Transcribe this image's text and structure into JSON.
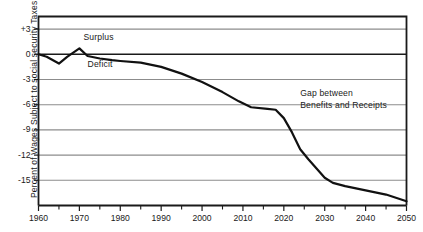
{
  "chart_data": {
    "type": "line",
    "title": "",
    "xlabel": "",
    "ylabel": "Percent of Wages Subject to social security Taxes",
    "xlim": [
      1960,
      2050
    ],
    "ylim": [
      -18,
      4.5
    ],
    "grid": true,
    "legend": "none",
    "x_ticks": [
      1960,
      1970,
      1980,
      1990,
      2000,
      2010,
      2020,
      2030,
      2040,
      2050
    ],
    "x_minor_ticks": [
      1965,
      1975,
      1985,
      1995,
      2005,
      2015,
      2025,
      2035,
      2045
    ],
    "y_ticks": [
      3,
      0,
      -3,
      -6,
      -9,
      -12,
      -15
    ],
    "y_tick_labels": [
      "+3",
      "0",
      "-3",
      "-6",
      "-9",
      "-12",
      "-15"
    ],
    "series": [
      {
        "name": "Gap between Benefits and Receipts",
        "color": "#111111",
        "x": [
          1960,
          1962,
          1965,
          1967,
          1970,
          1972,
          1975,
          1978,
          1980,
          1985,
          1990,
          1995,
          2000,
          2005,
          2009,
          2012,
          2016,
          2018,
          2020,
          2022,
          2024,
          2026,
          2028,
          2030,
          2032,
          2035,
          2040,
          2045,
          2050
        ],
        "values": [
          0.0,
          -0.3,
          -1.1,
          -0.3,
          0.7,
          -0.2,
          -0.5,
          -0.7,
          -0.8,
          -1.0,
          -1.5,
          -2.3,
          -3.3,
          -4.5,
          -5.6,
          -6.3,
          -6.5,
          -6.6,
          -7.6,
          -9.3,
          -11.3,
          -12.5,
          -13.6,
          -14.7,
          -15.3,
          -15.7,
          -16.2,
          -16.7,
          -17.5
        ]
      }
    ],
    "annotations": [
      {
        "text": "Surplus",
        "x": 1971,
        "y": 2.0
      },
      {
        "text": "Deficit",
        "x": 1972,
        "y": -1.3
      },
      {
        "text": "Gap between",
        "x": 2024,
        "y": -4.6
      },
      {
        "text": "Benefits and Receipts",
        "x": 2024,
        "y": -5.9
      }
    ],
    "colors": {
      "line": "#111111",
      "grid": "#8c8c8c",
      "axis": "#1a1a1a",
      "zero_line": "#1a1a1a",
      "background": "#ffffff"
    }
  },
  "labels": {
    "y_axis_title": "Percent of Wages Subject to social security Taxes",
    "annotation_surplus": "Surplus",
    "annotation_deficit": "Deficit",
    "annotation_gap_line1": "Gap between",
    "annotation_gap_line2": "Benefits and Receipts"
  }
}
